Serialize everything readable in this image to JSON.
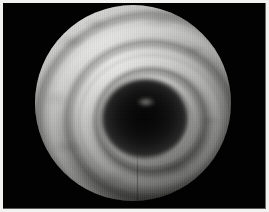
{
  "image": {
    "kind": "photograph",
    "modality": "endoscopy",
    "subject": "tracheal-lumen-with-cartilage-rings",
    "rendering": "grayscale",
    "caption": "",
    "width": 269,
    "height": 212
  },
  "frame": {
    "border_color": "#f2f2f0",
    "border_width_px": 3,
    "inner_edge_right_color": "#6d6d6d",
    "inner_edge_bottom_color": "#5a5a5a"
  },
  "field": {
    "background_color": "#020202",
    "aperture_shape": "circle",
    "aperture_center_x": 133,
    "aperture_center_y": 103,
    "aperture_radius": 98
  },
  "scene": {
    "wall_highlight_color": "#e8e8e6",
    "wall_midtone_color": "#a8a8a6",
    "wall_shadow_color": "#3a3a38",
    "lumen_core_color": "#050505",
    "ring_count_visible": 7,
    "lumen_center_x": 145,
    "lumen_center_y": 118,
    "illumination_origin": "upper-left"
  },
  "labels": {
    "overlay_text": "",
    "annotations": []
  }
}
